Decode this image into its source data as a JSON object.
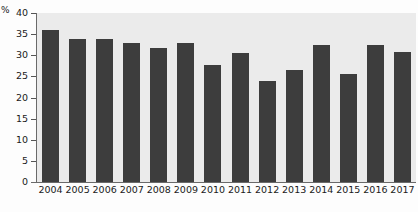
{
  "chart_data": {
    "type": "bar",
    "title": "",
    "subtitle": "",
    "xlabel": "",
    "ylabel": "%",
    "unit_label": "%",
    "categories": [
      "2004",
      "2005",
      "2006",
      "2007",
      "2008",
      "2009",
      "2010",
      "2011",
      "2012",
      "2013",
      "2014",
      "2015",
      "2016",
      "2017"
    ],
    "values": [
      36.0,
      33.9,
      33.9,
      33.0,
      31.8,
      32.8,
      27.8,
      30.5,
      23.8,
      26.5,
      32.5,
      25.5,
      32.5,
      30.7
    ],
    "ylim": [
      0,
      40
    ],
    "yticks": [
      0,
      5,
      10,
      15,
      20,
      25,
      30,
      35,
      40
    ],
    "ytick_labels": [
      "0",
      "5",
      "10",
      "15",
      "20",
      "25",
      "30",
      "35",
      "40"
    ],
    "grid": false,
    "legend": null,
    "legend_position": "none",
    "bar_color": "#3d3d3d",
    "plot_background": "#ebebeb",
    "axis_color": "#6a6a6a"
  }
}
